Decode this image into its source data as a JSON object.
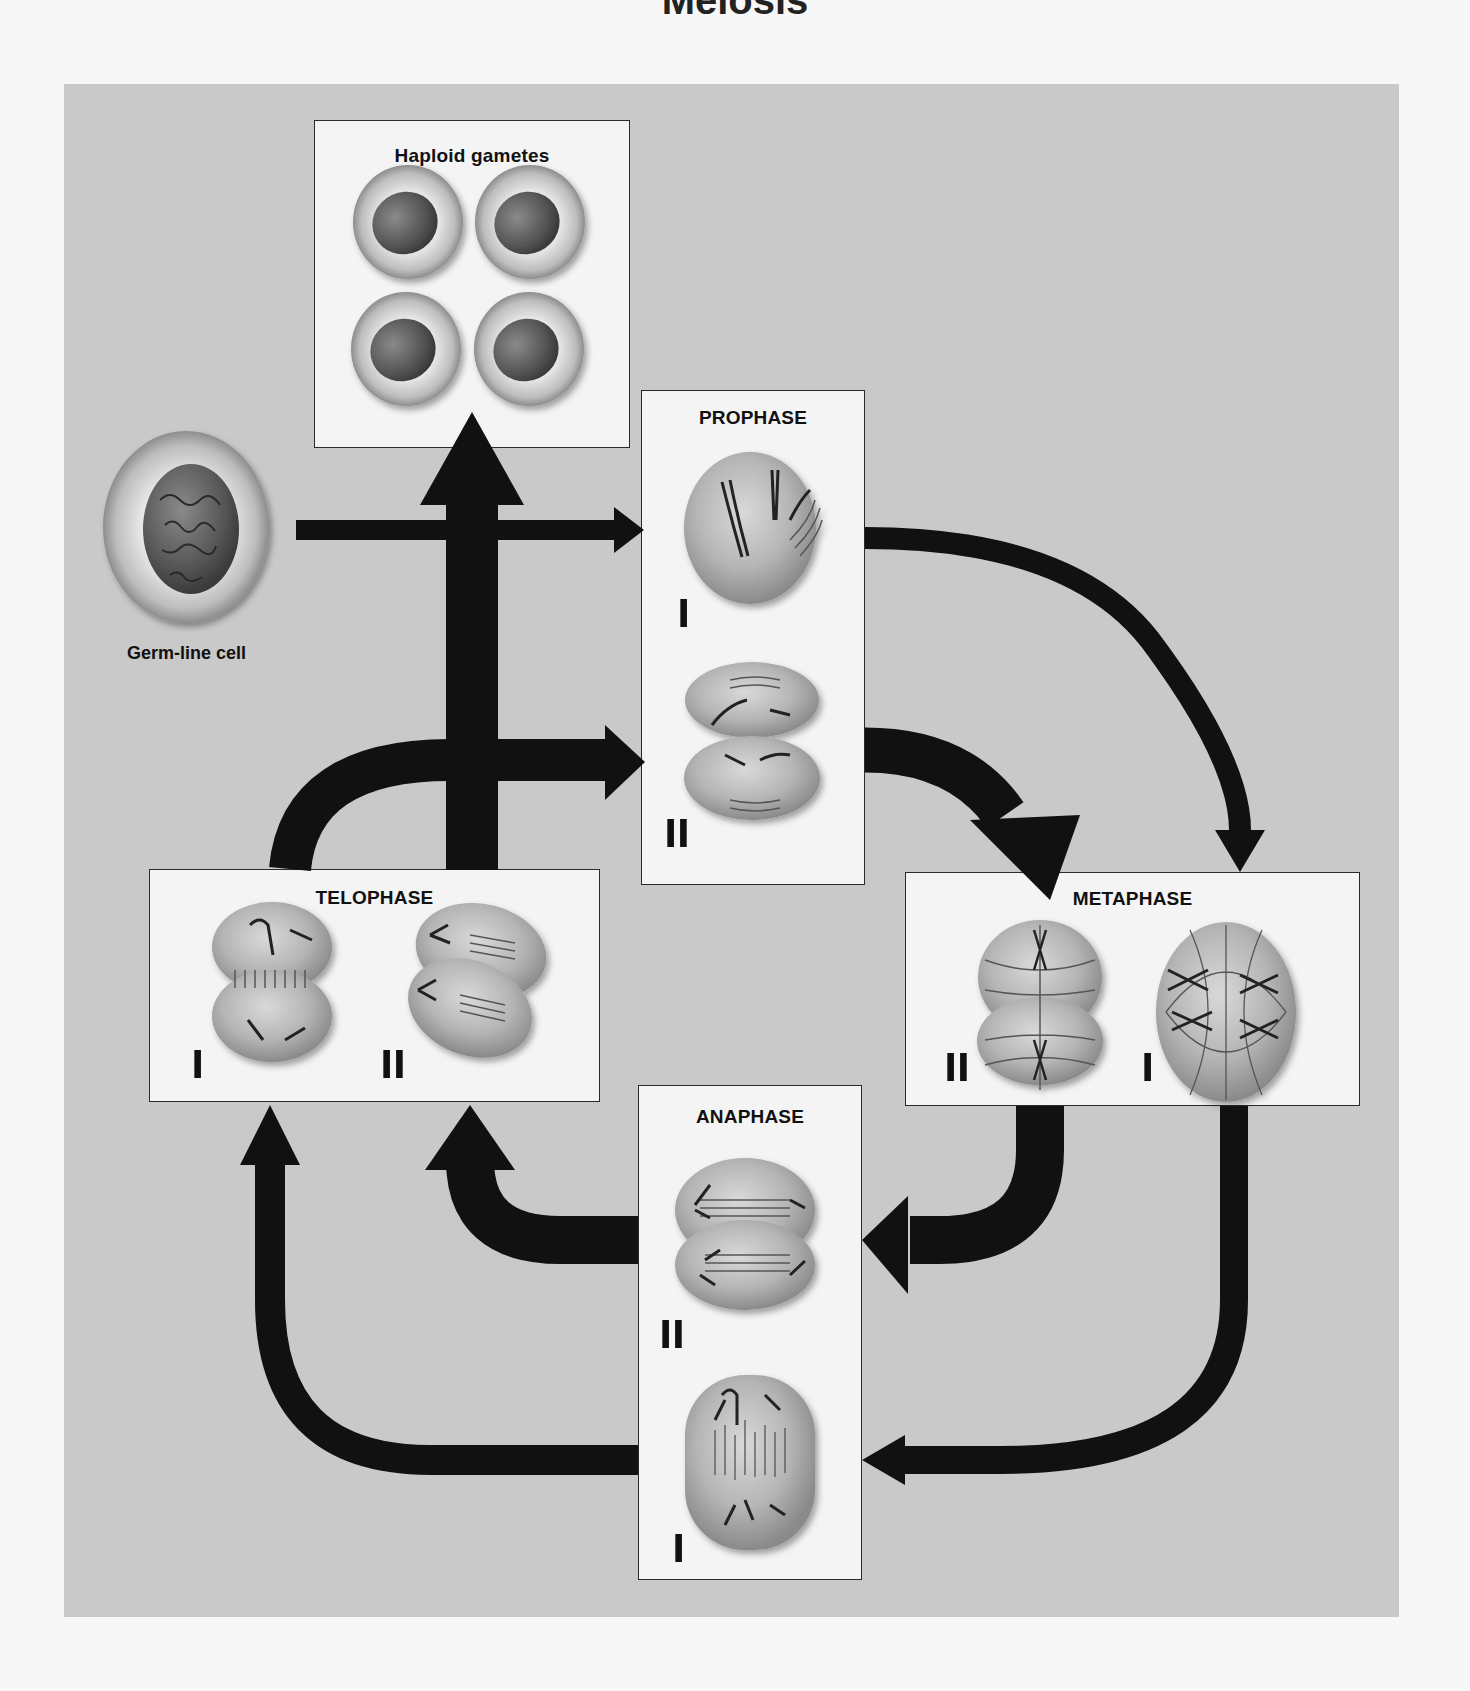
{
  "figure": {
    "title_fragment": "Meiosis",
    "background_color": "#c9c9c9",
    "box_color": "#f4f4f4",
    "arrow_color": "#111111"
  },
  "nodes": {
    "germ_line_cell": {
      "label": "Germ-line cell"
    },
    "haploid_gametes": {
      "label": "Haploid gametes",
      "count": 4
    },
    "prophase": {
      "label": "PROPHASE",
      "stages": [
        "I",
        "II"
      ]
    },
    "metaphase": {
      "label": "METAPHASE",
      "stages": [
        "II",
        "I"
      ]
    },
    "anaphase": {
      "label": "ANAPHASE",
      "stages": [
        "II",
        "I"
      ]
    },
    "telophase": {
      "label": "TELOPHASE",
      "stages": [
        "I",
        "II"
      ]
    }
  },
  "flow": [
    {
      "from": "Germ-line cell",
      "to": "Prophase I"
    },
    {
      "from": "Prophase I",
      "to": "Metaphase I"
    },
    {
      "from": "Metaphase I",
      "to": "Anaphase I"
    },
    {
      "from": "Anaphase I",
      "to": "Telophase I"
    },
    {
      "from": "Telophase I",
      "to": "Prophase II"
    },
    {
      "from": "Prophase II",
      "to": "Metaphase II"
    },
    {
      "from": "Metaphase II",
      "to": "Anaphase II"
    },
    {
      "from": "Anaphase II",
      "to": "Telophase II"
    },
    {
      "from": "Telophase II",
      "to": "Haploid gametes"
    }
  ]
}
